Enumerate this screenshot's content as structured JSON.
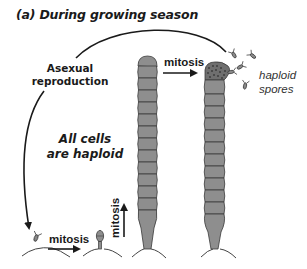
{
  "figure": {
    "title": "(a) During growing season",
    "labels": {
      "asexual_line1": "Asexual",
      "asexual_line2": "reproduction",
      "all_cells_line1": "All cells",
      "all_cells_line2": "are haploid",
      "spores_line1": "haploid",
      "spores_line2": "spores",
      "mitosis_bottom": "mitosis",
      "mitosis_vertical": "mitosis",
      "mitosis_top": "mitosis"
    },
    "colors": {
      "cell_fill": "#8e8e8e",
      "cell_stroke": "#3a3a3a",
      "line": "#1a1a1a",
      "text": "#1a1a1a"
    },
    "stages": [
      {
        "name": "spore",
        "description": "single haploid spore landing on substrate"
      },
      {
        "name": "germling",
        "description": "young cell with holdfast"
      },
      {
        "name": "filament",
        "description": "multicellular filament",
        "cells": 12
      },
      {
        "name": "sporulating-filament",
        "description": "filament releasing haploid spores",
        "cells": 11
      }
    ]
  }
}
